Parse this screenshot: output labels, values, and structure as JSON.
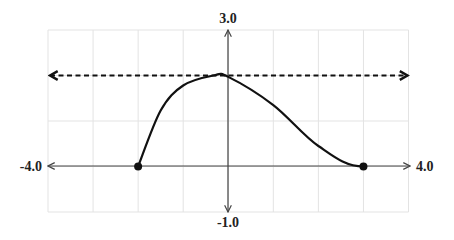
{
  "chart_data": {
    "type": "line",
    "title": "",
    "xlabel": "",
    "ylabel": "",
    "xlim": [
      -4.0,
      4.0
    ],
    "ylim": [
      -1.0,
      3.0
    ],
    "grid": true,
    "grid_step": 1,
    "axis_labels": {
      "x_min": "-4.0",
      "x_max": "4.0",
      "y_min": "-1.0",
      "y_max": "3.0"
    },
    "series": [
      {
        "name": "curve",
        "style": "solid",
        "x": [
          -2.0,
          -1.5,
          -1.0,
          -0.33,
          0.0,
          1.0,
          2.0,
          3.0
        ],
        "y": [
          0.0,
          1.23,
          1.78,
          2.0,
          1.97,
          1.35,
          0.45,
          0.0
        ],
        "endpoints": [
          {
            "x": -2.0,
            "y": 0.0,
            "marker": "closed-dot"
          },
          {
            "x": 3.0,
            "y": 0.0,
            "marker": "closed-dot"
          }
        ]
      },
      {
        "name": "horizontal-asymptote-line",
        "style": "dashed",
        "x": [
          -4.0,
          4.0
        ],
        "y": [
          2.0,
          2.0
        ],
        "arrows": "both"
      }
    ],
    "colors": {
      "curve": "#111111",
      "grid": "#e0e0e0",
      "axis": "#444444"
    }
  }
}
